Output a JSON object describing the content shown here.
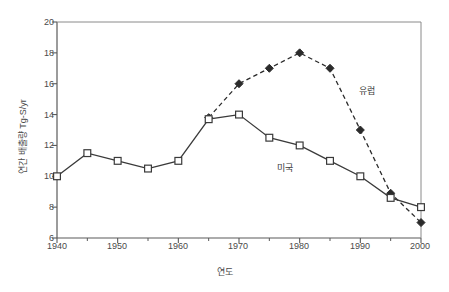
{
  "chart_data": {
    "type": "line",
    "title": "",
    "xlabel": "연도",
    "ylabel": "연간 배출량 Tg-S/yr",
    "xlim": [
      1940,
      2000
    ],
    "ylim": [
      6,
      20
    ],
    "xticks": [
      1940,
      1950,
      1960,
      1970,
      1980,
      1990,
      2000
    ],
    "xminorticks": [
      1945,
      1955,
      1965,
      1975,
      1985,
      1995
    ],
    "yticks": [
      6,
      8,
      10,
      12,
      14,
      16,
      18,
      20
    ],
    "grid": false,
    "legend_position": "inline-annotation",
    "series": [
      {
        "name": "미국",
        "marker": "open-square",
        "linestyle": "solid",
        "color": "#3a3a3a",
        "x": [
          1940,
          1945,
          1950,
          1955,
          1960,
          1965,
          1970,
          1975,
          1980,
          1985,
          1990,
          1995,
          2000
        ],
        "values": [
          10.0,
          11.5,
          11.0,
          10.5,
          11.0,
          13.7,
          14.0,
          12.5,
          12.0,
          11.0,
          10.0,
          8.6,
          8.0
        ]
      },
      {
        "name": "유럽",
        "marker": "filled-diamond",
        "linestyle": "dashed",
        "color": "#2b2b2b",
        "x": [
          1965,
          1970,
          1975,
          1980,
          1985,
          1990,
          1995,
          2000
        ],
        "values": [
          13.8,
          16.0,
          17.0,
          18.0,
          17.0,
          13.0,
          8.9,
          7.0
        ]
      }
    ],
    "annotations": [
      {
        "text": "유럽",
        "x": 1991.5,
        "y": 15.0
      },
      {
        "text": "미국",
        "x": 1977.0,
        "y": 10.9
      }
    ]
  },
  "axis": {
    "ytick_labels": [
      "20",
      "18",
      "16",
      "14",
      "12",
      "10",
      "8",
      "6"
    ],
    "xtick_labels": [
      "1940",
      "1950",
      "1960",
      "1970",
      "1980",
      "1990",
      "2000"
    ]
  },
  "colors": {
    "axis": "#5a5a5a",
    "us_line": "#3a3a3a",
    "eu_line": "#2b2b2b",
    "text": "#4a4a4a",
    "background": "#ffffff"
  }
}
